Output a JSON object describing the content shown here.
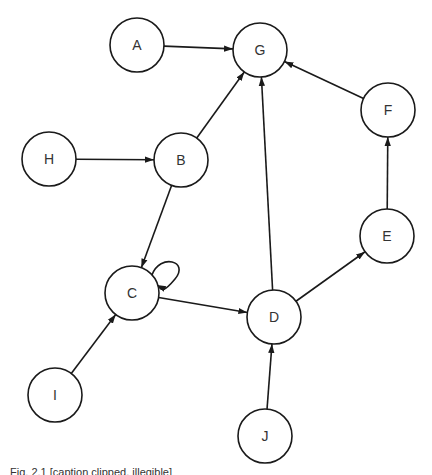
{
  "diagram": {
    "type": "directed-graph",
    "node_radius": 27,
    "stroke_color": "#1a1a1a",
    "nodes": [
      {
        "id": "A",
        "label": "A",
        "x": 137,
        "y": 45
      },
      {
        "id": "G",
        "label": "G",
        "x": 260,
        "y": 50
      },
      {
        "id": "F",
        "label": "F",
        "x": 388,
        "y": 110
      },
      {
        "id": "H",
        "label": "H",
        "x": 49,
        "y": 159
      },
      {
        "id": "B",
        "label": "B",
        "x": 181,
        "y": 160
      },
      {
        "id": "E",
        "label": "E",
        "x": 387,
        "y": 236
      },
      {
        "id": "C",
        "label": "C",
        "x": 132,
        "y": 293
      },
      {
        "id": "D",
        "label": "D",
        "x": 274,
        "y": 317
      },
      {
        "id": "I",
        "label": "I",
        "x": 55,
        "y": 395
      },
      {
        "id": "J",
        "label": "J",
        "x": 265,
        "y": 436
      }
    ],
    "edges": [
      {
        "from": "A",
        "to": "G"
      },
      {
        "from": "F",
        "to": "G"
      },
      {
        "from": "B",
        "to": "G"
      },
      {
        "from": "D",
        "to": "G"
      },
      {
        "from": "H",
        "to": "B"
      },
      {
        "from": "B",
        "to": "C"
      },
      {
        "from": "C",
        "to": "C"
      },
      {
        "from": "C",
        "to": "D"
      },
      {
        "from": "I",
        "to": "C"
      },
      {
        "from": "J",
        "to": "D"
      },
      {
        "from": "D",
        "to": "E"
      },
      {
        "from": "E",
        "to": "F"
      }
    ]
  },
  "caption": {
    "text": "Fig. 2.1 [caption clipped, illegible]"
  }
}
